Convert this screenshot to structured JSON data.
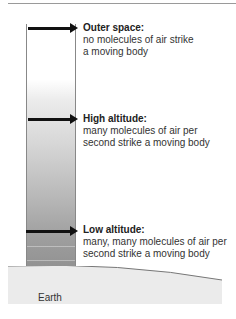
{
  "diagram": {
    "levels": [
      {
        "title": "Outer space:",
        "lines": [
          "no molecules of air strike",
          "a moving body"
        ]
      },
      {
        "title": "High altitude:",
        "lines": [
          "many molecules of air per",
          "second strike a moving body"
        ]
      },
      {
        "title": "Low altitude:",
        "lines": [
          "many, many molecules of air per",
          "second strike a moving body"
        ]
      }
    ],
    "ground_label": "Earth"
  }
}
